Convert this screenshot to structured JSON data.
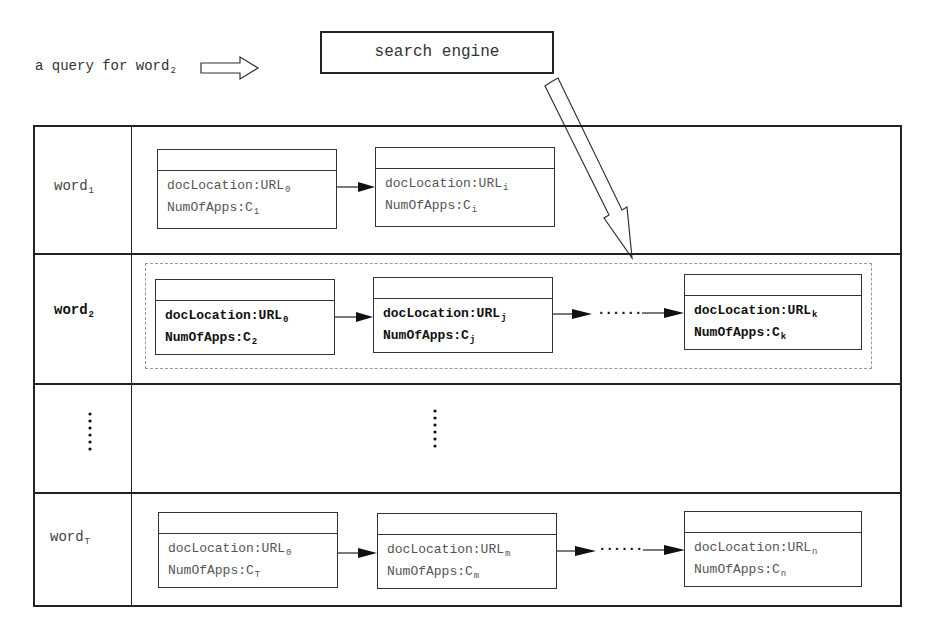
{
  "query": {
    "text": "a query for word",
    "sub": "2"
  },
  "search_engine": {
    "label": "search engine"
  },
  "rows": [
    {
      "word": "word",
      "word_sub": "1",
      "bold": false,
      "nodes": [
        {
          "loc": "docLocation:URL",
          "loc_sub": "0",
          "apps": "NumOfApps:C",
          "apps_sub": "1"
        },
        {
          "loc": "docLocation:URL",
          "loc_sub": "i",
          "apps": "NumOfApps:C",
          "apps_sub": "i"
        }
      ]
    },
    {
      "word": "word",
      "word_sub": "2",
      "bold": true,
      "nodes": [
        {
          "loc": "docLocation:URL",
          "loc_sub": "0",
          "apps": "NumOfApps:C",
          "apps_sub": "2"
        },
        {
          "loc": "docLocation:URL",
          "loc_sub": "j",
          "apps": "NumOfApps:C",
          "apps_sub": "j"
        },
        {
          "loc": "docLocation:URL",
          "loc_sub": "k",
          "apps": "NumOfApps:C",
          "apps_sub": "k"
        }
      ],
      "ellipsis": "......"
    },
    {
      "word": "......",
      "ellipsis_vertical": true
    },
    {
      "word": "word",
      "word_sub": "T",
      "bold": false,
      "nodes": [
        {
          "loc": "docLocation:URL",
          "loc_sub": "0",
          "apps": "NumOfApps:C",
          "apps_sub": "T"
        },
        {
          "loc": "docLocation:URL",
          "loc_sub": "m",
          "apps": "NumOfApps:C",
          "apps_sub": "m"
        },
        {
          "loc": "docLocation:URL",
          "loc_sub": "n",
          "apps": "NumOfApps:C",
          "apps_sub": "n"
        }
      ],
      "ellipsis": "......"
    }
  ],
  "colors": {
    "line": "#222222",
    "dashed": "#999999",
    "text": "#444444"
  }
}
